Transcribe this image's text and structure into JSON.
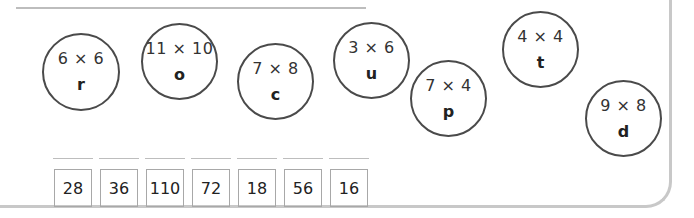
{
  "puzzle": {
    "circles": [
      {
        "expression": "6 × 6",
        "letter": "r"
      },
      {
        "expression": "11 × 10",
        "letter": "o"
      },
      {
        "expression": "7 × 8",
        "letter": "c"
      },
      {
        "expression": "3 × 6",
        "letter": "u"
      },
      {
        "expression": "7 × 4",
        "letter": "p"
      },
      {
        "expression": "4 × 4",
        "letter": "t"
      },
      {
        "expression": "9 × 8",
        "letter": "d"
      }
    ],
    "answer_boxes": [
      "28",
      "36",
      "110",
      "72",
      "18",
      "56",
      "16"
    ],
    "answer_blanks": [
      "",
      "",
      "",
      "",
      "",
      "",
      ""
    ]
  }
}
